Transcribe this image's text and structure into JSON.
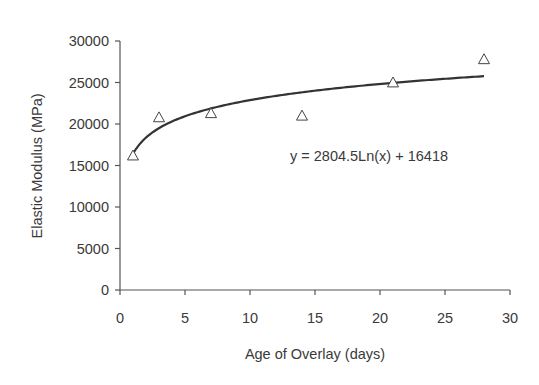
{
  "chart_data": {
    "type": "scatter",
    "title": "",
    "xlabel": "Age of Overlay (days)",
    "ylabel": "Elastic Modulus (MPa)",
    "xlim": [
      0,
      30
    ],
    "ylim": [
      0,
      30000
    ],
    "xticks": [
      0,
      5,
      10,
      15,
      20,
      25,
      30
    ],
    "yticks": [
      0,
      5000,
      10000,
      15000,
      20000,
      25000,
      30000
    ],
    "grid": false,
    "series": [
      {
        "name": "Measured",
        "marker": "triangle-open",
        "x": [
          1,
          3,
          7,
          14,
          21,
          28
        ],
        "y": [
          16200,
          20800,
          21300,
          21000,
          25000,
          27800
        ]
      }
    ],
    "trendline": {
      "type": "logarithmic",
      "a": 2804.5,
      "b": 16418,
      "x_range": [
        1,
        28
      ]
    },
    "annotations": [
      {
        "text": "y = 2804.5Ln(x) + 16418"
      }
    ]
  },
  "colors": {
    "axis": "#555555",
    "line": "#333333",
    "text": "#3a3a3a"
  }
}
